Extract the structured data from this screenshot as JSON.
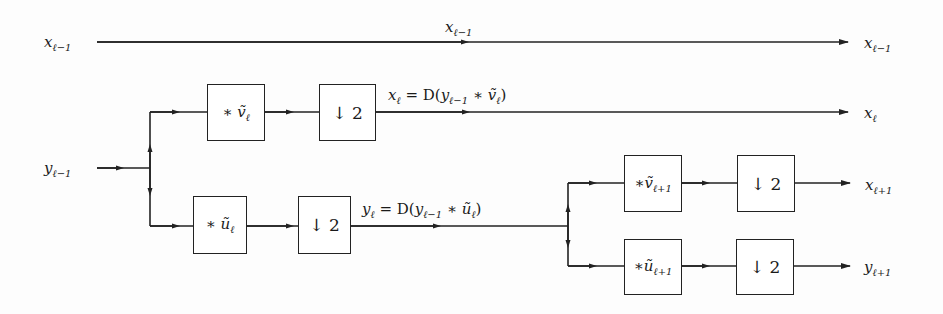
{
  "diagram": {
    "type": "two-level filter bank (wavelet decomposition)",
    "stroke_color": "#222222",
    "inputs": {
      "x_prev": {
        "var": "x",
        "sub": "ℓ−1"
      },
      "y_prev": {
        "var": "y",
        "sub": "ℓ−1"
      }
    },
    "top_line": {
      "mid_label": {
        "var": "x",
        "sub": "ℓ−1"
      },
      "output": {
        "var": "x",
        "sub": "ℓ−1"
      }
    },
    "stage1": {
      "upper": {
        "filter": {
          "prefix": "∗",
          "var": "ṽ",
          "sub": "ℓ"
        },
        "down": "↓ 2",
        "equation": {
          "lhs_var": "x",
          "lhs_sub": "ℓ",
          "eq": " = D(",
          "in_var": "y",
          "in_sub": "ℓ−1",
          "op": " ∗ ",
          "f_var": "ṽ",
          "f_sub": "ℓ",
          "close": ")"
        },
        "output": {
          "var": "x",
          "sub": "ℓ"
        }
      },
      "lower": {
        "filter": {
          "prefix": "∗",
          "var": "ũ",
          "sub": "ℓ"
        },
        "down": "↓ 2",
        "equation": {
          "lhs_var": "y",
          "lhs_sub": "ℓ",
          "eq": " = D(",
          "in_var": "y",
          "in_sub": "ℓ−1",
          "op": " ∗ ",
          "f_var": "ũ",
          "f_sub": "ℓ",
          "close": ")"
        }
      }
    },
    "stage2": {
      "upper": {
        "filter": {
          "prefix": "∗",
          "var": "ṽ",
          "sub": "ℓ+1"
        },
        "down": "↓ 2",
        "output": {
          "var": "x",
          "sub": "ℓ+1"
        }
      },
      "lower": {
        "filter": {
          "prefix": "∗",
          "var": "ũ",
          "sub": "ℓ+1"
        },
        "down": "↓ 2",
        "output": {
          "var": "y",
          "sub": "ℓ+1"
        }
      }
    }
  }
}
